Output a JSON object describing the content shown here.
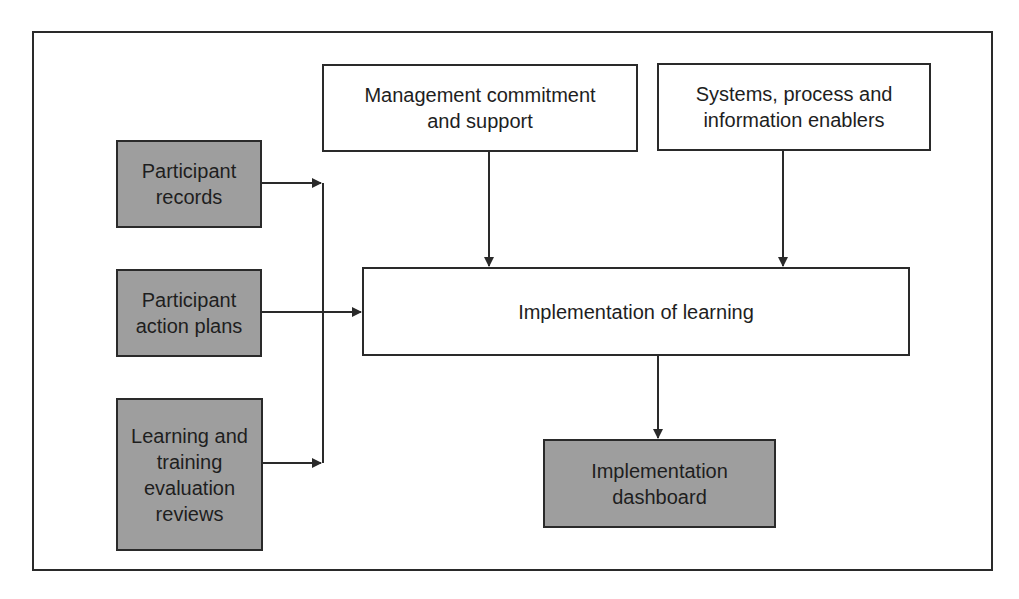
{
  "diagram": {
    "colors": {
      "input_fill": "#9e9e9e",
      "process_fill": "#ffffff",
      "line": "#2a2a2a"
    },
    "nodes": {
      "participant_records": {
        "label": "Participant\nrecords",
        "kind": "input"
      },
      "participant_action_plans": {
        "label": "Participant\naction plans",
        "kind": "input"
      },
      "learning_training_reviews": {
        "label": "Learning and\ntraining\nevaluation\nreviews",
        "kind": "input"
      },
      "management_commitment": {
        "label": "Management commitment\nand support",
        "kind": "enabler"
      },
      "systems_enablers": {
        "label": "Systems, process and\ninformation enablers",
        "kind": "enabler"
      },
      "implementation_of_learning": {
        "label": "Implementation of learning",
        "kind": "process"
      },
      "implementation_dashboard": {
        "label": "Implementation\ndashboard",
        "kind": "output"
      }
    },
    "edges": [
      {
        "from": "participant_records",
        "to": "implementation_of_learning"
      },
      {
        "from": "participant_action_plans",
        "to": "implementation_of_learning"
      },
      {
        "from": "learning_training_reviews",
        "to": "implementation_of_learning"
      },
      {
        "from": "management_commitment",
        "to": "implementation_of_learning"
      },
      {
        "from": "systems_enablers",
        "to": "implementation_of_learning"
      },
      {
        "from": "implementation_of_learning",
        "to": "implementation_dashboard"
      }
    ]
  }
}
